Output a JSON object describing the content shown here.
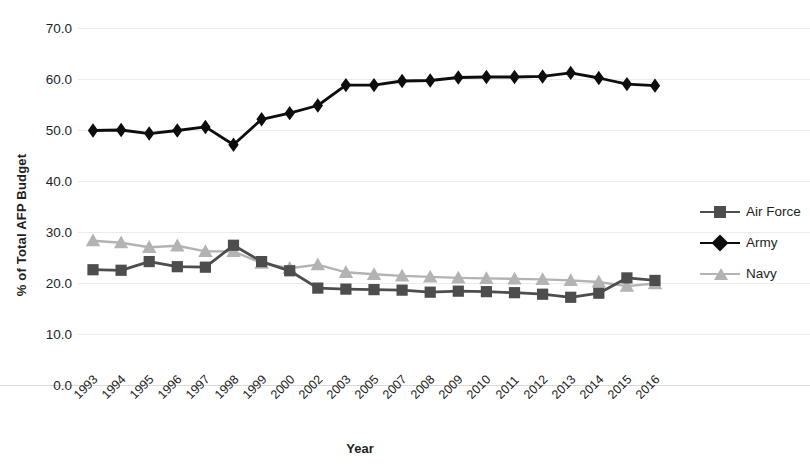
{
  "chart_data": {
    "type": "line",
    "title": "",
    "xlabel": "Year",
    "ylabel": "% of Total AFP Budget",
    "ylim": [
      0.0,
      70.0
    ],
    "ytick_step": 10.0,
    "yticks": [
      "70.0",
      "60.0",
      "50.0",
      "40.0",
      "30.0",
      "20.0",
      "10.0",
      "0.0"
    ],
    "grid": true,
    "legend_position": "right",
    "categories": [
      "1993",
      "1994",
      "1995",
      "1996",
      "1997",
      "1998",
      "1999",
      "2000",
      "2002",
      "2003",
      "2005",
      "2007",
      "2008",
      "2009",
      "2010",
      "2011",
      "2012",
      "2013",
      "2014",
      "2015",
      "2016"
    ],
    "series": [
      {
        "name": "Air Force",
        "color": "#4d4d4d",
        "marker": "square",
        "values": [
          22.6,
          22.5,
          24.2,
          23.2,
          23.1,
          27.4,
          24.2,
          22.4,
          19.0,
          18.8,
          18.7,
          18.6,
          18.2,
          18.4,
          18.3,
          18.1,
          17.8,
          17.2,
          18.0,
          21.0,
          20.5
        ]
      },
      {
        "name": "Army",
        "color": "#0d0d0d",
        "marker": "diamond",
        "values": [
          49.9,
          50.0,
          49.3,
          49.9,
          50.6,
          47.1,
          52.1,
          53.3,
          54.8,
          58.8,
          58.8,
          59.6,
          59.7,
          60.3,
          60.4,
          60.4,
          60.5,
          61.2,
          60.2,
          59.0,
          58.7
        ]
      },
      {
        "name": "Navy",
        "color": "#b3b3b3",
        "marker": "triangle",
        "values": [
          28.3,
          27.9,
          27.0,
          27.3,
          26.2,
          26.2,
          23.9,
          22.9,
          23.6,
          22.1,
          21.7,
          21.4,
          21.2,
          21.0,
          20.9,
          20.8,
          20.7,
          20.5,
          20.2,
          19.4,
          19.9
        ]
      }
    ]
  },
  "legend": {
    "items": [
      {
        "label": "Air Force",
        "color": "#4d4d4d",
        "marker": "square"
      },
      {
        "label": "Army",
        "color": "#0d0d0d",
        "marker": "diamond"
      },
      {
        "label": "Navy",
        "color": "#b3b3b3",
        "marker": "triangle"
      }
    ]
  },
  "axes": {
    "x_title": "Year",
    "y_title": "% of Total AFP Budget"
  }
}
